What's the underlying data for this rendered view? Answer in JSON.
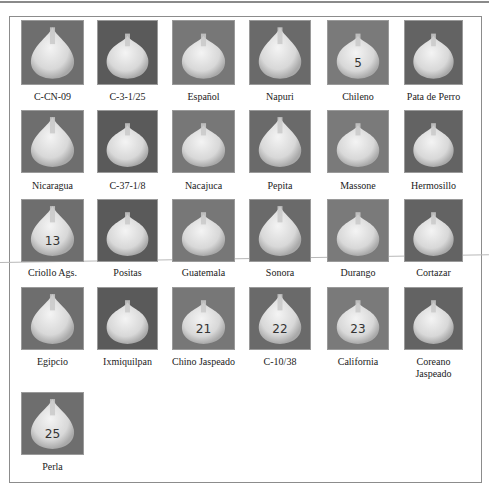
{
  "figure": {
    "varieties": [
      {
        "label": "C-CN-09",
        "mark": ""
      },
      {
        "label": "C-3-1/25",
        "mark": ""
      },
      {
        "label": "Español",
        "mark": ""
      },
      {
        "label": "Napuri",
        "mark": ""
      },
      {
        "label": "Chileno",
        "mark": "5"
      },
      {
        "label": "Pata de Perro",
        "mark": ""
      },
      {
        "label": "Nicaragua",
        "mark": ""
      },
      {
        "label": "C-37-1/8",
        "mark": ""
      },
      {
        "label": "Nacajuca",
        "mark": ""
      },
      {
        "label": "Pepita",
        "mark": ""
      },
      {
        "label": "Massone",
        "mark": ""
      },
      {
        "label": "Hermosillo",
        "mark": ""
      },
      {
        "label": "Criollo Ags.",
        "mark": "13"
      },
      {
        "label": "Positas",
        "mark": ""
      },
      {
        "label": "Guatemala",
        "mark": ""
      },
      {
        "label": "Sonora",
        "mark": ""
      },
      {
        "label": "Durango",
        "mark": ""
      },
      {
        "label": "Cortazar",
        "mark": ""
      },
      {
        "label": "Egipcio",
        "mark": ""
      },
      {
        "label": "Ixmiquilpan",
        "mark": ""
      },
      {
        "label": "Chino Jaspeado",
        "mark": "21"
      },
      {
        "label": "C-10/38",
        "mark": "22"
      },
      {
        "label": "California",
        "mark": "23"
      },
      {
        "label": "Coreano\nJaspeado",
        "mark": ""
      },
      {
        "label": "Perla",
        "mark": "25"
      }
    ]
  }
}
